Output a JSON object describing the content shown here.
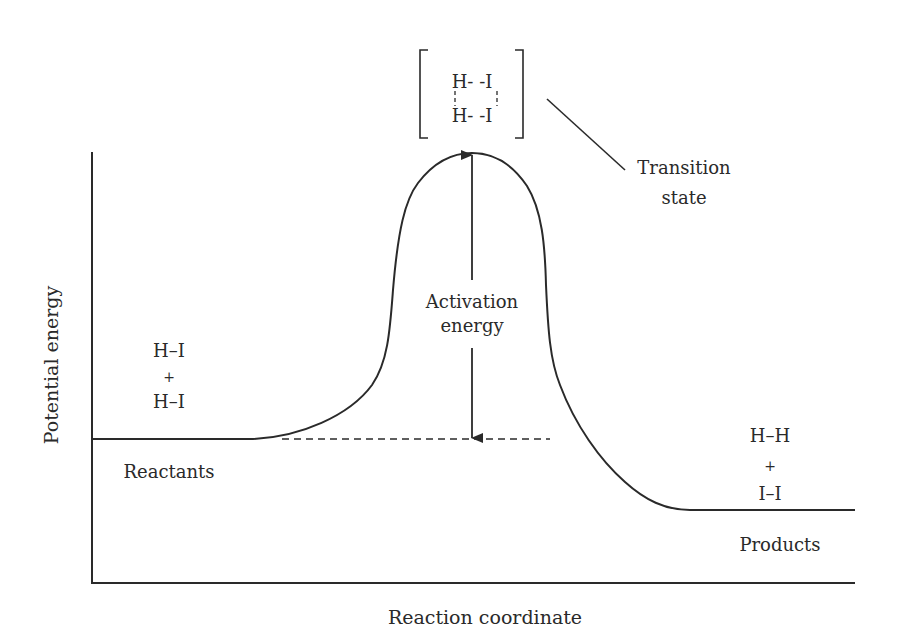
{
  "diagram": {
    "type": "reaction-energy-profile",
    "axes": {
      "x_label": "Reaction coordinate",
      "y_label": "Potential energy"
    },
    "reactants": {
      "line1": "H–I",
      "plus": "+",
      "line2": "H–I",
      "label": "Reactants"
    },
    "products": {
      "line1": "H–H",
      "plus": "+",
      "line2": "I–I",
      "label": "Products"
    },
    "transition_state": {
      "structure_top": "H- -I",
      "structure_bottom": "H- -I",
      "label_line1": "Transition",
      "label_line2": "state"
    },
    "activation_energy": {
      "label_line1": "Activation",
      "label_line2": "energy"
    },
    "colors": {
      "ink": "#2a2a2a",
      "background": "#ffffff"
    }
  }
}
